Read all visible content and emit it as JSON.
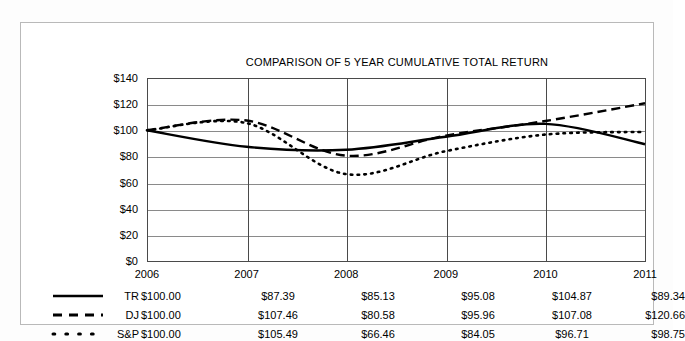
{
  "chart_data": {
    "type": "line",
    "title": "COMPARISON OF 5 YEAR CUMULATIVE TOTAL RETURN",
    "xlabel": "",
    "ylabel": "",
    "categories": [
      "2006",
      "2007",
      "2008",
      "2009",
      "2010",
      "2011"
    ],
    "ylim": [
      0,
      140
    ],
    "yticks": [
      "$0",
      "$20",
      "$40",
      "$60",
      "$80",
      "$100",
      "$120",
      "$140"
    ],
    "ytick_values": [
      0,
      20,
      40,
      60,
      80,
      100,
      120,
      140
    ],
    "grid": true,
    "legend_position": "bottom-table",
    "series": [
      {
        "name": "TR",
        "style": "solid",
        "color": "#000000",
        "values": [
          100.0,
          87.39,
          85.13,
          95.08,
          104.87,
          89.34
        ],
        "labels": [
          "$100.00",
          "$87.39",
          "$85.13",
          "$95.08",
          "$104.87",
          "$89.34"
        ]
      },
      {
        "name": "DJ",
        "style": "dashed",
        "color": "#000000",
        "values": [
          100.0,
          107.46,
          80.58,
          95.96,
          107.08,
          120.66
        ],
        "labels": [
          "$100.00",
          "$107.46",
          "$80.58",
          "$95.96",
          "$107.08",
          "$120.66"
        ]
      },
      {
        "name": "S&P",
        "style": "dotted",
        "color": "#000000",
        "values": [
          100.0,
          105.49,
          66.46,
          84.05,
          96.71,
          98.75
        ],
        "labels": [
          "$100.00",
          "$105.49",
          "$66.46",
          "$84.05",
          "$96.71",
          "$98.75"
        ]
      }
    ]
  }
}
